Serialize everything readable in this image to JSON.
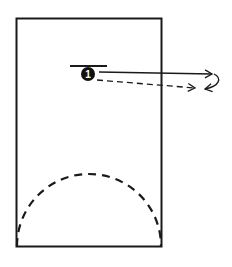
{
  "diagram": {
    "type": "basketball-play",
    "court": {
      "x": 16,
      "y": 18,
      "width": 146,
      "height": 229,
      "stroke": "#1a1a1a"
    },
    "arc": {
      "style": "dashed",
      "cx": 89,
      "cy": 247,
      "rx": 72,
      "ry": 72
    },
    "players": [
      {
        "id": "1",
        "label": "1",
        "cx": 88,
        "cy": 74,
        "r": 7,
        "fill": "#111111"
      }
    ],
    "screen_bar": {
      "x1": 70,
      "y1": 66,
      "x2": 107,
      "y2": 66
    },
    "paths": [
      {
        "name": "cut-path",
        "style": "solid",
        "x1": 98,
        "y1": 72,
        "x2": 212,
        "y2": 74
      },
      {
        "name": "dribble-path",
        "style": "dashed",
        "x1": 97,
        "y1": 80,
        "x2": 195,
        "y2": 88
      },
      {
        "name": "return-curve",
        "style": "solid-curved",
        "from": [
          214,
          74
        ],
        "to": [
          205,
          89
        ]
      }
    ]
  }
}
